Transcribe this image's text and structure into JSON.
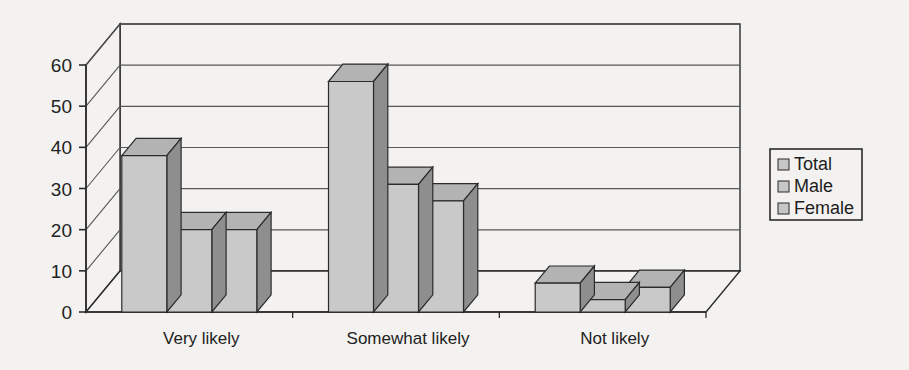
{
  "chart_data": {
    "type": "bar",
    "title": "",
    "subtitle": "",
    "xlabel": "",
    "ylabel": "",
    "categories": [
      "Very likely",
      "Somewhat likely",
      "Not likely"
    ],
    "series": [
      {
        "name": "Total",
        "values": [
          38,
          56,
          7
        ]
      },
      {
        "name": "Male",
        "values": [
          20,
          31,
          3
        ]
      },
      {
        "name": "Female",
        "values": [
          20,
          27,
          6
        ]
      }
    ],
    "ylim": [
      0,
      60
    ],
    "yticks": [
      0,
      10,
      20,
      30,
      40,
      50,
      60
    ],
    "ytick_labels": [
      "0",
      "10",
      "20",
      "30",
      "40",
      "50",
      "60"
    ],
    "grid": true,
    "grid_axis": "y",
    "legend": {
      "position": "right",
      "entries": [
        "Total",
        "Male",
        "Female"
      ]
    },
    "style": "3d-clustered-column",
    "annotations": []
  },
  "axes": {
    "y_ticks": [
      {
        "value": 60,
        "label": "60"
      },
      {
        "value": 50,
        "label": "50"
      },
      {
        "value": 40,
        "label": "40"
      },
      {
        "value": 30,
        "label": "30"
      },
      {
        "value": 20,
        "label": "20"
      },
      {
        "value": 10,
        "label": "10"
      },
      {
        "value": 0,
        "label": "0"
      }
    ],
    "x_categories": [
      {
        "label": "Very likely"
      },
      {
        "label": "Somewhat likely"
      },
      {
        "label": "Not likely"
      }
    ]
  },
  "legend": {
    "items": [
      {
        "label": "Total",
        "swatch_color": "#c6c6c6"
      },
      {
        "label": "Male",
        "swatch_color": "#c6c6c6"
      },
      {
        "label": "Female",
        "swatch_color": "#c6c6c6"
      }
    ]
  },
  "colors": {
    "background": "#f3f2f0",
    "bar_front": "#c9c9c9",
    "bar_side": "#8e8e8e",
    "bar_top": "#b3b3b3",
    "outline": "#2b2b2b",
    "gridline": "#575757",
    "wall": "#f3f2f0",
    "text": "#222222"
  }
}
